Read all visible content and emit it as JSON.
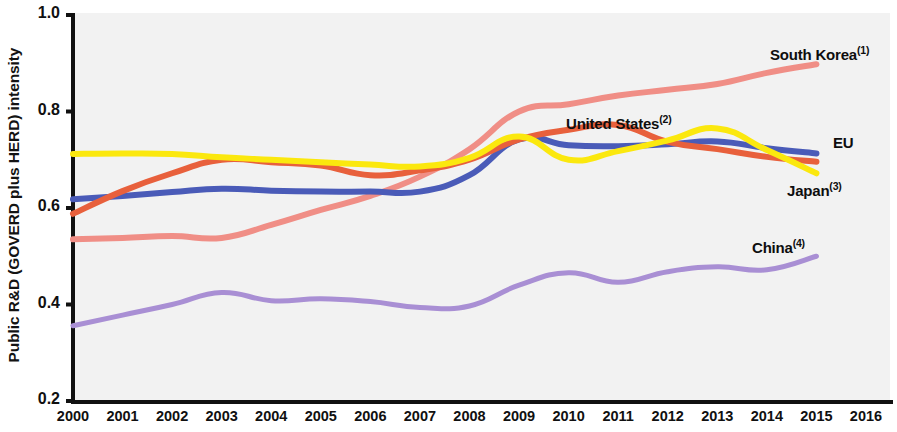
{
  "chart_data": {
    "type": "line",
    "title": "",
    "xlabel": "",
    "ylabel": "Public R&D (GOVERD plus HERD) intensity",
    "x": [
      2000,
      2001,
      2002,
      2003,
      2004,
      2005,
      2006,
      2007,
      2008,
      2009,
      2010,
      2011,
      2012,
      2013,
      2014,
      2015
    ],
    "xlim": [
      2000,
      2016
    ],
    "ylim": [
      0.2,
      1.0
    ],
    "y_ticks": [
      "0.2",
      "0.4",
      "0.6",
      "0.8",
      "1.0"
    ],
    "y_tick_values": [
      0.2,
      0.4,
      0.6,
      0.8,
      1.0
    ],
    "x_ticks": [
      "2000",
      "2001",
      "2002",
      "2003",
      "2004",
      "2005",
      "2006",
      "2007",
      "2008",
      "2009",
      "2010",
      "2011",
      "2012",
      "2013",
      "2014",
      "2015",
      "2016"
    ],
    "grid": false,
    "legend_position": "inline-end-of-line",
    "plot_background": "#f2f2f2",
    "series": [
      {
        "name": "South Korea",
        "label": "South Korea",
        "footnote": "(1)",
        "color": "#f08e86",
        "values": [
          0.535,
          0.538,
          0.542,
          0.538,
          0.565,
          0.596,
          0.625,
          0.665,
          0.722,
          0.8,
          0.815,
          0.833,
          0.845,
          0.857,
          0.88,
          0.898
        ]
      },
      {
        "name": "United States",
        "label": "United States",
        "footnote": "(2)",
        "color": "#e8603c",
        "values": [
          0.588,
          0.635,
          0.672,
          0.7,
          0.695,
          0.688,
          0.668,
          0.678,
          0.7,
          0.742,
          0.762,
          0.772,
          0.737,
          0.722,
          0.706,
          0.696
        ]
      },
      {
        "name": "EU",
        "label": "EU",
        "footnote": "",
        "color": "#4a5bb8",
        "values": [
          0.618,
          0.625,
          0.633,
          0.64,
          0.636,
          0.634,
          0.634,
          0.634,
          0.668,
          0.742,
          0.73,
          0.728,
          0.732,
          0.738,
          0.724,
          0.713
        ]
      },
      {
        "name": "Japan",
        "label": "Japan",
        "footnote": "(3)",
        "color": "#fbe80e",
        "values": [
          0.712,
          0.713,
          0.712,
          0.705,
          0.7,
          0.695,
          0.69,
          0.686,
          0.704,
          0.748,
          0.7,
          0.718,
          0.74,
          0.765,
          0.72,
          0.672
        ]
      },
      {
        "name": "China",
        "label": "China",
        "footnote": "(4)",
        "color": "#a98fd4",
        "values": [
          0.356,
          0.378,
          0.4,
          0.425,
          0.408,
          0.412,
          0.406,
          0.394,
          0.397,
          0.44,
          0.466,
          0.446,
          0.468,
          0.478,
          0.472,
          0.5
        ]
      }
    ],
    "annotations": [
      {
        "text": "South Korea",
        "footnote": "(1)",
        "x": 770,
        "y": 44
      },
      {
        "text": "United States",
        "footnote": "(2)",
        "x": 566,
        "y": 113
      },
      {
        "text": "EU",
        "footnote": "",
        "x": 833,
        "y": 134
      },
      {
        "text": "Japan",
        "footnote": "(3)",
        "x": 787,
        "y": 180
      },
      {
        "text": "China",
        "footnote": "(4)",
        "x": 752,
        "y": 237
      }
    ]
  }
}
